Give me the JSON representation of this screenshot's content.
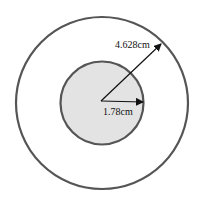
{
  "diagram": {
    "outer_circle": {
      "radius_label": "4.628cm",
      "stroke": "#555555",
      "fill": "#ffffff"
    },
    "inner_circle": {
      "radius_label": "1.78cm",
      "stroke": "#555555",
      "fill": "#e3e3e3"
    },
    "arrow_color": "#111111"
  }
}
